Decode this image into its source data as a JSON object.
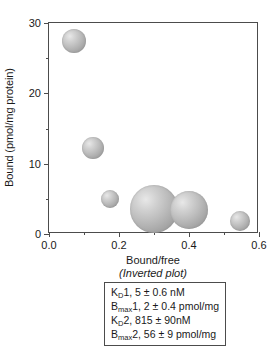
{
  "chart_data": {
    "type": "scatter",
    "title": "",
    "xlabel": "Bound/free",
    "xsublabel": "(Inverted plot)",
    "ylabel": "Bound (pmol/mg protein)",
    "xlim": [
      0.0,
      0.6
    ],
    "ylim": [
      0,
      30
    ],
    "grid": false,
    "legend": null,
    "xticks": [
      {
        "value": 0.0,
        "label": "0.0",
        "major": true
      },
      {
        "value": 0.1,
        "label": "",
        "major": false
      },
      {
        "value": 0.2,
        "label": "0.2",
        "major": true
      },
      {
        "value": 0.3,
        "label": "",
        "major": false
      },
      {
        "value": 0.4,
        "label": "0.4",
        "major": true
      },
      {
        "value": 0.5,
        "label": "",
        "major": false
      },
      {
        "value": 0.6,
        "label": "0.6",
        "major": true
      }
    ],
    "yticks": [
      {
        "value": 0,
        "label": "0",
        "major": true
      },
      {
        "value": 5,
        "label": "",
        "major": false
      },
      {
        "value": 10,
        "label": "10",
        "major": true
      },
      {
        "value": 15,
        "label": "",
        "major": false
      },
      {
        "value": 20,
        "label": "20",
        "major": true
      },
      {
        "value": 25,
        "label": "",
        "major": false
      },
      {
        "value": 30,
        "label": "30",
        "major": true
      }
    ],
    "marker_style": "shaded-gray-sphere",
    "points": [
      {
        "x": 0.07,
        "y": 27.5,
        "size_px": 24
      },
      {
        "x": 0.125,
        "y": 12.2,
        "size_px": 22
      },
      {
        "x": 0.175,
        "y": 5.0,
        "size_px": 18
      },
      {
        "x": 0.3,
        "y": 3.5,
        "size_px": 48
      },
      {
        "x": 0.4,
        "y": 3.4,
        "size_px": 38
      },
      {
        "x": 0.545,
        "y": 1.8,
        "size_px": 20
      }
    ]
  },
  "annotation": {
    "lines": [
      {
        "symbol": "K",
        "sub": "D",
        "rest": "1, 5 ± 0.6 nM"
      },
      {
        "symbol": "B",
        "sub": "max",
        "rest": "1, 2 ± 0.4 pmol/mg"
      },
      {
        "symbol": "K",
        "sub": "D",
        "rest": "2, 815 ± 90nM"
      },
      {
        "symbol": "B",
        "sub": "max",
        "rest": "2, 56 ± 9 pmol/mg"
      }
    ]
  },
  "colors": {
    "axis": "#4c4c4c",
    "text": "#1a1a1a",
    "bubble_light": "#e8e8e8",
    "bubble_dark": "#8f8f8f",
    "background": "#ffffff"
  }
}
